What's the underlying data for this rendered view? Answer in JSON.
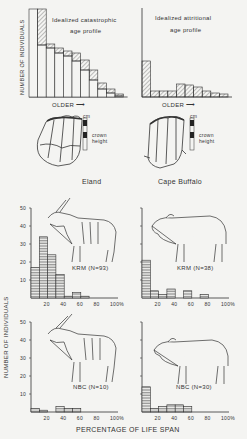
{
  "figure": {
    "y_axis_label": "NUMBER OF INDIVIDUALS",
    "x_axis_label": "PERCENTAGE OF LIFE SPAN",
    "older_label": "OLDER",
    "teeth": {
      "scale_unit": "cm",
      "crown_label_1": "crown",
      "crown_label_2": "height",
      "eland_label": "Eland",
      "buffalo_label": "Cape Buffalo"
    }
  },
  "chart_data": [
    {
      "type": "bar",
      "title": "Idealized catastrophic age profile",
      "title_line1": "Idealized catastrophic",
      "title_line2": "age profile",
      "xlabel": "OLDER",
      "ylabel": "NUMBER OF INDIVIDUALS",
      "categories": [
        "1",
        "2",
        "3",
        "4",
        "5",
        "6",
        "7",
        "8",
        "9",
        "10",
        "11"
      ],
      "series": [
        {
          "name": "open (survivors)",
          "values": [
            88,
            52,
            49,
            44,
            41,
            36,
            27,
            17,
            8,
            4,
            1
          ]
        },
        {
          "name": "hatched (deaths)",
          "values": [
            0,
            36,
            4,
            5,
            5,
            8,
            10,
            10,
            6,
            4,
            2
          ]
        }
      ],
      "totals": [
        88,
        88,
        53,
        49,
        46,
        44,
        37,
        27,
        14,
        8,
        3
      ]
    },
    {
      "type": "bar",
      "title": "Idealized attritional age profile",
      "title_line1": "Idealized attritional",
      "title_line2": "age profile",
      "xlabel": "OLDER",
      "ylabel": "NUMBER OF INDIVIDUALS",
      "categories": [
        "1",
        "2",
        "3",
        "4",
        "5",
        "6",
        "7",
        "8",
        "9",
        "10"
      ],
      "values": [
        36,
        6,
        6,
        6,
        13,
        12,
        10,
        6,
        4,
        3
      ]
    },
    {
      "type": "bar",
      "title": "KRM (N=93)",
      "species": "Eland",
      "xlabel": "PERCENTAGE OF LIFE SPAN",
      "ylabel": "NUMBER OF INDIVIDUALS",
      "x_ticks": [
        "20",
        "40",
        "60",
        "80",
        "100%"
      ],
      "y_ticks": [
        "10",
        "20",
        "30",
        "40",
        "50"
      ],
      "ylim": [
        0,
        50
      ],
      "bin_width": 10,
      "categories": [
        "0-10",
        "10-20",
        "20-30",
        "30-40",
        "40-50",
        "50-60",
        "60-70",
        "70-80",
        "80-90",
        "90-100"
      ],
      "values": [
        17,
        34,
        24,
        13,
        1,
        3,
        1,
        0,
        0,
        0
      ]
    },
    {
      "type": "bar",
      "title": "KRM (N=38)",
      "species": "Cape Buffalo",
      "xlabel": "PERCENTAGE OF LIFE SPAN",
      "ylabel": "NUMBER OF INDIVIDUALS",
      "x_ticks": [
        "20",
        "40",
        "60",
        "80",
        "100%"
      ],
      "ylim": [
        0,
        50
      ],
      "bin_width": 10,
      "categories": [
        "0-10",
        "10-20",
        "20-30",
        "30-40",
        "40-50",
        "50-60",
        "60-70",
        "70-80",
        "80-90",
        "90-100"
      ],
      "values": [
        21,
        4,
        2,
        5,
        0,
        4,
        0,
        2,
        0,
        0
      ]
    },
    {
      "type": "bar",
      "title": "NBC (N=10)",
      "species": "Eland",
      "xlabel": "PERCENTAGE OF LIFE SPAN",
      "ylabel": "NUMBER OF INDIVIDUALS",
      "x_ticks": [
        "20",
        "40",
        "60",
        "80",
        "100%"
      ],
      "y_ticks": [
        "10",
        "20",
        "30",
        "40",
        "50"
      ],
      "ylim": [
        0,
        50
      ],
      "bin_width": 10,
      "categories": [
        "0-10",
        "10-20",
        "20-30",
        "30-40",
        "40-50",
        "50-60",
        "60-70",
        "70-80",
        "80-90",
        "90-100"
      ],
      "values": [
        2,
        1,
        0,
        3,
        2,
        2,
        0,
        0,
        0,
        0
      ]
    },
    {
      "type": "bar",
      "title": "NBC (N=30)",
      "species": "Cape Buffalo",
      "xlabel": "PERCENTAGE OF LIFE SPAN",
      "ylabel": "NUMBER OF INDIVIDUALS",
      "x_ticks": [
        "20",
        "40",
        "60",
        "80",
        "100%"
      ],
      "ylim": [
        0,
        50
      ],
      "bin_width": 10,
      "categories": [
        "0-10",
        "10-20",
        "20-30",
        "30-40",
        "40-50",
        "50-60",
        "60-70",
        "70-80",
        "80-90",
        "90-100"
      ],
      "values": [
        14,
        2,
        3,
        4,
        4,
        3,
        0,
        0,
        0,
        0
      ]
    }
  ]
}
